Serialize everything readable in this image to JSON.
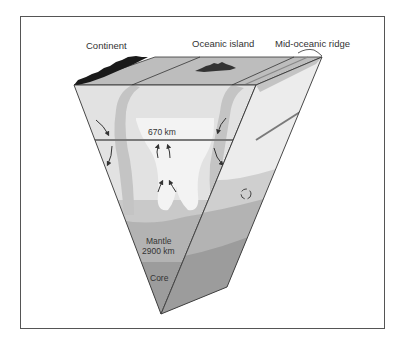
{
  "diagram": {
    "type": "earth-cross-section-block",
    "labels": {
      "continent": "Continent",
      "oceanic_island": "Oceanic island",
      "mid_oceanic_ridge": "Mid-oceanic ridge",
      "boundary_670": "670 km",
      "mantle": "Mantle",
      "mantle_depth": "2900 km",
      "core": "Core"
    },
    "colors": {
      "frame": "#555555",
      "outline": "#333333",
      "ocean_surface": "#bdbdbd",
      "upper_mantle": "#e2e2e2",
      "slab": "#c4c4c4",
      "plume": "#f3f3f3",
      "lower_mantle": "#bcbcbc",
      "deep_mantle": "#a7a7a7",
      "core": "#969696",
      "boundary_line": "#7a7a7a",
      "landmass": "#1a1a1a",
      "arrow": "#333333"
    }
  }
}
